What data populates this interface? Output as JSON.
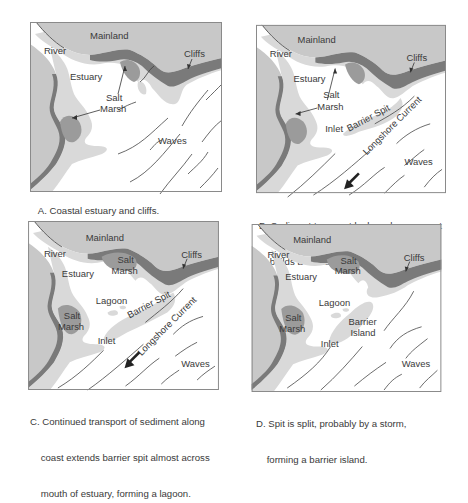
{
  "figure": {
    "colors": {
      "mainland": "#c8c8c8",
      "sediment": "#d9d9d9",
      "salt_marsh": "#9b9b9b",
      "cliffs": "#7a7a7a",
      "water": "#ffffff",
      "frame": "#8a8a8a"
    },
    "panels": [
      {
        "id": "A",
        "labels": {
          "mainland": "Mainland",
          "river": "River",
          "cliffs": "Cliffs",
          "estuary": "Estuary",
          "salt": "Salt",
          "marsh": "Marsh",
          "waves": "Waves"
        },
        "caption_line1": "A. Coastal estuary and cliffs.",
        "caption_line2": ""
      },
      {
        "id": "B",
        "labels": {
          "mainland": "Mainland",
          "river": "River",
          "cliffs": "Cliffs",
          "estuary": "Estuary",
          "salt": "Salt",
          "marsh": "Marsh",
          "barrier_spit": "Barrier Spit",
          "inlet": "Inlet",
          "longshore_current": "Longshore Current",
          "waves": "Waves"
        },
        "caption_line1": "B. Sediment transport by longshore current",
        "caption_line2": "    builds a barrier spit."
      },
      {
        "id": "C",
        "labels": {
          "mainland": "Mainland",
          "river": "River",
          "cliffs": "Cliffs",
          "estuary": "Estuary",
          "salt_top": "Salt",
          "marsh_top": "Marsh",
          "salt": "Salt",
          "marsh": "Marsh",
          "lagoon": "Lagoon",
          "barrier_spit": "Barrier Spit",
          "inlet": "Inlet",
          "longshore_current": "Longshore Current",
          "waves": "Waves"
        },
        "caption_line1": "C. Continued transport of sediment along",
        "caption_line2": "    coast extends barrier spit almost across",
        "caption_line3": "    mouth of estuary, forming a lagoon."
      },
      {
        "id": "D",
        "labels": {
          "mainland": "Mainland",
          "river": "River",
          "cliffs": "Cliffs",
          "estuary": "Estuary",
          "salt_top": "Salt",
          "marsh_top": "Marsh",
          "salt": "Salt",
          "marsh": "Marsh",
          "lagoon": "Lagoon",
          "barrier": "Barrier",
          "island": "Island",
          "inlet": "Inlet",
          "waves": "Waves"
        },
        "caption_line1": "D. Spit is split, probably by a storm,",
        "caption_line2": "    forming a barrier island."
      }
    ]
  }
}
